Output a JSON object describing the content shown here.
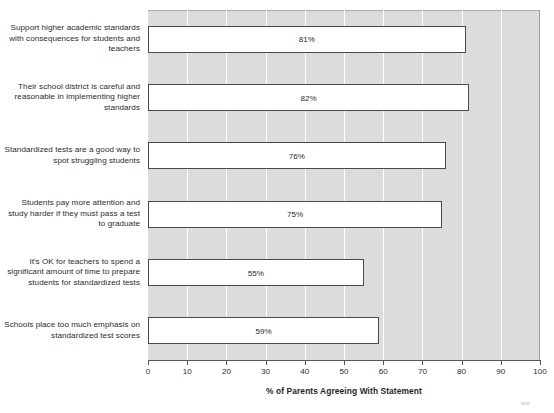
{
  "chart_data": {
    "type": "bar",
    "orientation": "horizontal",
    "title": "",
    "xlabel": "% of Parents Agreeing With Statement",
    "ylabel": "",
    "xlim": [
      0,
      100
    ],
    "xticks": [
      0,
      10,
      20,
      30,
      40,
      50,
      60,
      70,
      80,
      90,
      100
    ],
    "xtick_labels": [
      "0",
      "10",
      "20",
      "30",
      "40",
      "50",
      "60",
      "70",
      "80",
      "90",
      "100"
    ],
    "grid": "vertical",
    "legend": "none",
    "categories": [
      "Support higher academic standards with consequences for students and teachers",
      "Their school district is careful and reasonable in implementing higher standards",
      "Standardized tests are a good way to spot struggling students",
      "Students pay more attention and study harder if they must pass a test to graduate",
      "It's OK for teachers to spend a significant amount of time to prepare students for standardized tests",
      "Schools place too much emphasis on standardized test scores"
    ],
    "values": [
      81,
      82,
      76,
      75,
      55,
      59
    ],
    "value_labels": [
      "81%",
      "82%",
      "76%",
      "75%",
      "55%",
      "59%"
    ],
    "colors": {
      "bar_fill": "#ffffff",
      "bar_border": "#4a4a4a",
      "plot_background": "#dcdcdc",
      "gridline": "#ffffff",
      "axis": "#555555",
      "text": "#2b2b2b"
    }
  }
}
